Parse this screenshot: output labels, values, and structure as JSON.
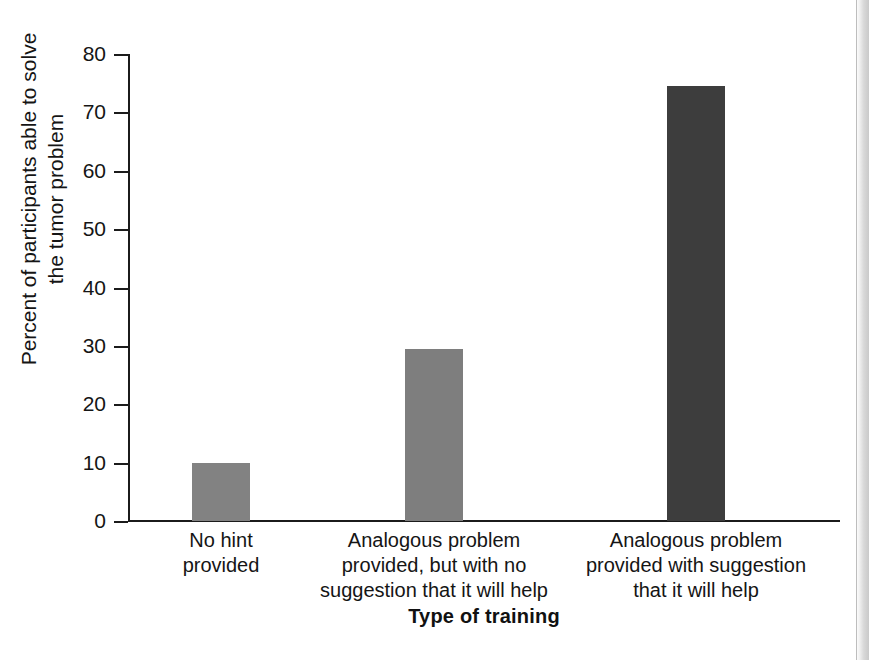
{
  "chart_data": {
    "type": "bar",
    "title": "",
    "xlabel": "Type of training",
    "ylabel": "Percent of participants able to solve\nthe tumor problem",
    "ylabel_line1": "Percent of participants able to solve",
    "ylabel_line2": "the tumor problem",
    "categories": [
      "No hint\nprovided",
      "Analogous problem\nprovided, but with no\nsuggestion that it will help",
      "Analogous problem\nprovided with suggestion\nthat it will help"
    ],
    "values": [
      10,
      29.5,
      74.5
    ],
    "bar_colors": [
      "#828282",
      "#7e7e7e",
      "#3d3d3d"
    ],
    "ylim": [
      0,
      80
    ],
    "ytick_labels": [
      "80",
      "70",
      "60",
      "50",
      "40",
      "30",
      "20",
      "10",
      "0"
    ],
    "ytick_values": [
      80,
      70,
      60,
      50,
      40,
      30,
      20,
      10,
      0
    ],
    "grid": false,
    "legend": null,
    "axis_color": "#1b1b1b"
  },
  "figure": {
    "background": "#ffffff",
    "page_edge_color": "#c9c9c9"
  }
}
